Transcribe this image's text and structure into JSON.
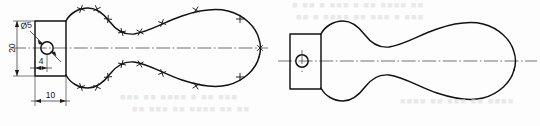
{
  "sheet": {
    "title": "Handle profile — two views",
    "width": 540,
    "height": 126,
    "background_color": "#fdfdfd",
    "line_color": "#111111"
  },
  "views": [
    {
      "id": "left-view",
      "name": "dimensioned-view",
      "label": "Left view with construction ticks and dimensions",
      "has_dimensions": true,
      "has_construction_ticks": true
    },
    {
      "id": "right-view",
      "name": "plain-view",
      "label": "Right view, finished outline without dimensions",
      "has_dimensions": false,
      "has_construction_ticks": false
    }
  ],
  "dimensions": [
    {
      "id": "dia5",
      "name": "hole-diameter",
      "text": "Ø5",
      "value": 5,
      "symbol": "Ø",
      "kind": "diameter-leader"
    },
    {
      "id": "height20",
      "name": "block-height",
      "text": "20",
      "value": 20,
      "kind": "vertical-linear"
    },
    {
      "id": "offset4",
      "name": "hole-offset",
      "text": "4",
      "value": 4,
      "kind": "horizontal-linear"
    },
    {
      "id": "width10",
      "name": "block-width",
      "text": "10",
      "value": 10,
      "kind": "horizontal-linear"
    }
  ],
  "geometry": {
    "left_block": {
      "x": 35,
      "y": 21,
      "width": 31,
      "height": 55
    },
    "left_hole": {
      "cx": 47,
      "cy": 48,
      "r": 6.2
    },
    "left_centerline": {
      "x1": 12,
      "y1": 48,
      "x2": 268,
      "y2": 48
    },
    "right_block": {
      "x": 290,
      "y": 34,
      "width": 31,
      "height": 55
    },
    "right_hole": {
      "cx": 302,
      "cy": 61,
      "r": 6.2
    },
    "right_centerline": {
      "x1": 278,
      "y1": 61,
      "x2": 536,
      "y2": 61
    }
  },
  "bleed_text": [
    {
      "text": "■ ■■ ■ ■■■ ■ ■■ ■■■■ ■■",
      "x": 292,
      "y": 4
    },
    {
      "text": "■■ ■ ■■■■ ■■ ■■■ ■ ■■■",
      "x": 296,
      "y": 16
    },
    {
      "text": "■■■ ■■ ■■■■ ■ ■■ ■■■",
      "x": 120,
      "y": 96
    },
    {
      "text": "■■ ■■■ ■■ ■■■■ ■■ ■■",
      "x": 132,
      "y": 108
    },
    {
      "text": "■■■■ ■■ ■■■ ■■ ■■■■",
      "x": 400,
      "y": 100
    }
  ]
}
